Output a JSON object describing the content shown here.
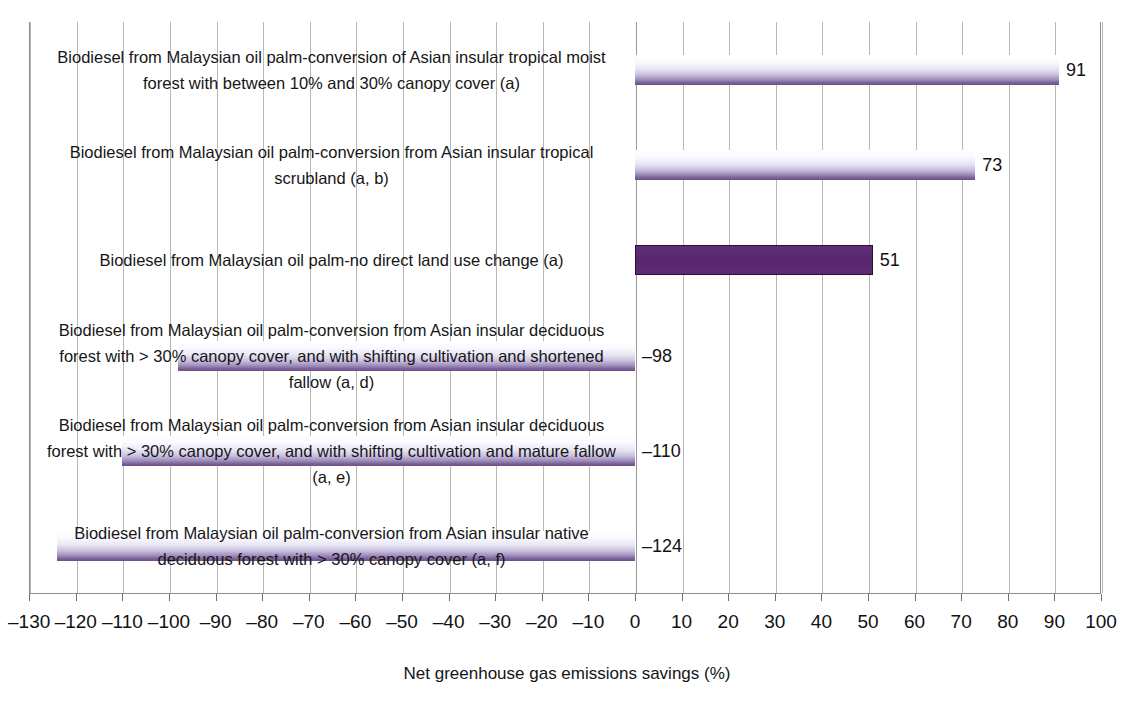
{
  "chart_data": {
    "type": "bar",
    "orientation": "horizontal",
    "title": "",
    "xlabel": "Net greenhouse gas emissions savings (%)",
    "ylabel": "",
    "xlim": [
      -130,
      100
    ],
    "xticks": [
      -130,
      -120,
      -110,
      -100,
      -90,
      -80,
      -70,
      -60,
      -50,
      -40,
      -30,
      -20,
      -10,
      0,
      10,
      20,
      30,
      40,
      50,
      60,
      70,
      80,
      90,
      100
    ],
    "xticklabels": [
      "–130",
      "–120",
      "–110",
      "–100",
      "–90",
      "–80",
      "–70",
      "–60",
      "–50",
      "–40",
      "–30",
      "–20",
      "–10",
      "0",
      "10",
      "20",
      "30",
      "40",
      "50",
      "60",
      "70",
      "80",
      "90",
      "100"
    ],
    "grid": "vertical",
    "legend": "none",
    "categories": [
      "Biodiesel from Malaysian oil palm-conversion of Asian insular tropical moist forest with between 10% and 30% canopy cover (a)",
      "Biodiesel from Malaysian oil palm-conversion from Asian insular tropical scrubland (a, b)",
      "Biodiesel from Malaysian oil palm-no direct land use change (a)",
      "Biodiesel from Malaysian oil palm-conversion from Asian insular deciduous forest with > 30% canopy cover, and with shifting cultivation and shortened fallow (a, d)",
      "Biodiesel from Malaysian oil palm-conversion from Asian insular deciduous forest with > 30% canopy cover, and with shifting cultivation and mature fallow (a, e)",
      "Biodiesel from Malaysian oil palm-conversion from Asian insular native deciduous forest with > 30% canopy cover (a, f)"
    ],
    "values": [
      91,
      73,
      51,
      -98,
      -110,
      -124
    ],
    "value_labels": [
      "91",
      "73",
      "51",
      "–98",
      "–110",
      "–124"
    ],
    "bar_styles": [
      "gradient",
      "gradient",
      "solid",
      "gradient",
      "gradient",
      "gradient"
    ],
    "colors": {
      "bar_gradient_top": "#ffffff",
      "bar_gradient_bottom": "#6e4f88",
      "bar_solid": "#5c2a72",
      "bar_solid_outline": "#2d1038",
      "gridline": "#b7b7b7",
      "axis": "#8c8c8c",
      "text": "#161616"
    }
  }
}
